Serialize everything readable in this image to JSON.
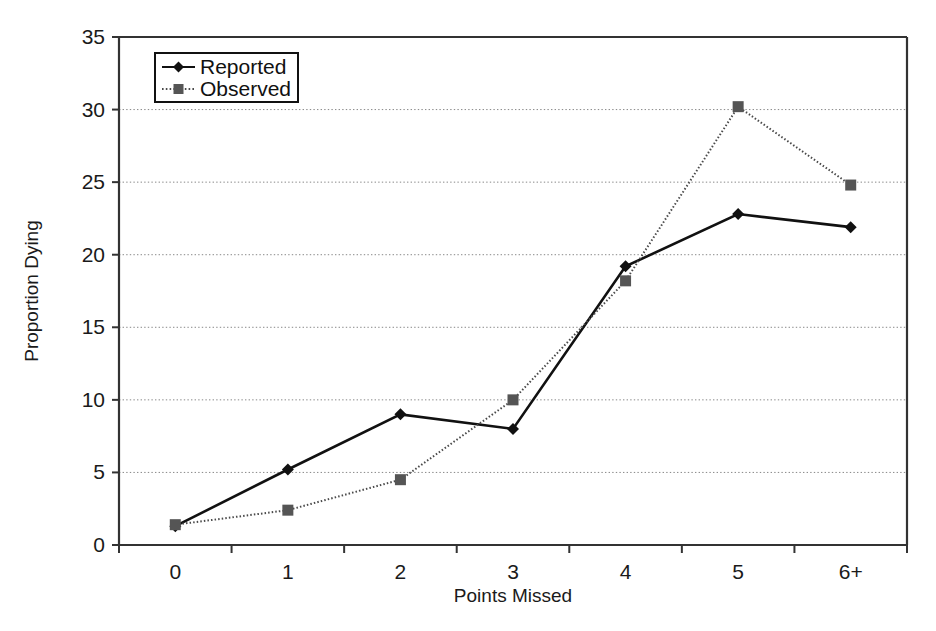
{
  "chart_data": {
    "type": "line",
    "title": "",
    "subtitle": "",
    "xlabel": "Points Missed",
    "ylabel": "Proportion Dying",
    "categories": [
      "0",
      "1",
      "2",
      "3",
      "4",
      "5",
      "6+"
    ],
    "x": [
      0,
      1,
      2,
      3,
      4,
      5,
      6
    ],
    "ylim": [
      0,
      35
    ],
    "xlim": [
      -0.5,
      6.5
    ],
    "yticks": [
      0,
      5,
      10,
      15,
      20,
      25,
      30,
      35
    ],
    "ytick_labels": [
      "0",
      "5",
      "10",
      "15",
      "20",
      "25",
      "30",
      "35"
    ],
    "xtick_labels": [
      "0",
      "1",
      "2",
      "3",
      "4",
      "5",
      "6+"
    ],
    "grid": "horizontal-dotted",
    "legend_position": "top-left-inside",
    "series": [
      {
        "name": "Reported",
        "values": [
          1.3,
          5.2,
          9.0,
          8.0,
          19.2,
          22.8,
          21.9
        ],
        "line_style": "solid",
        "marker": "diamond",
        "color": "#111111"
      },
      {
        "name": "Observed",
        "values": [
          1.4,
          2.4,
          4.5,
          10.0,
          18.2,
          30.2,
          24.8
        ],
        "line_style": "dotted",
        "marker": "square",
        "color": "#4a4a4a"
      }
    ],
    "annotations": []
  },
  "legend": {
    "entries": [
      {
        "label": "Reported"
      },
      {
        "label": "Observed"
      }
    ]
  },
  "colors": {
    "background": "#ffffff",
    "axis": "#333333",
    "gridline": "#888888",
    "reported": "#111111",
    "observed": "#4a4a4a",
    "text": "#1a1a1a"
  }
}
